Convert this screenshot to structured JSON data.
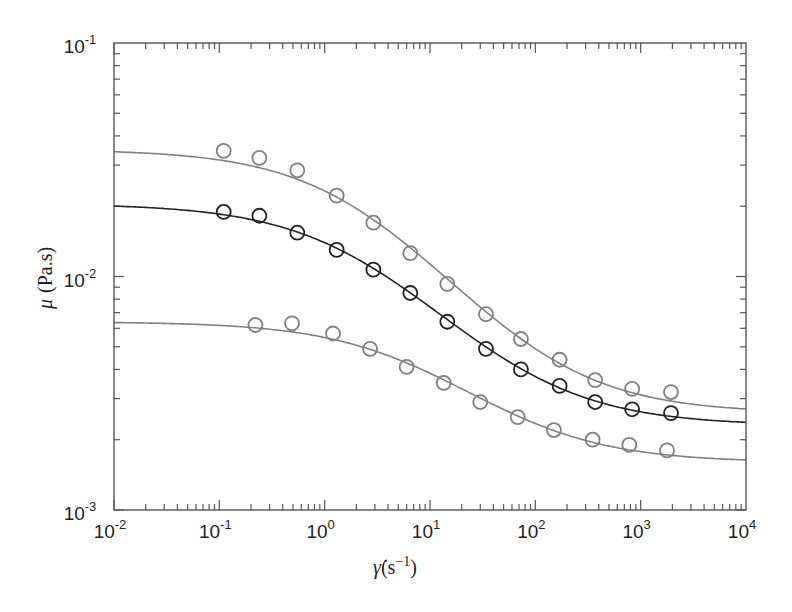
{
  "chart_data": {
    "type": "line",
    "title": "",
    "xlabel": "γ̇(s⁻¹)",
    "ylabel": "μ (Pa.s)",
    "xscale": "log",
    "yscale": "log",
    "xlim": [
      0.01,
      10000
    ],
    "ylim": [
      0.001,
      0.1
    ],
    "x_tick_labels": [
      "10^-2",
      "10^-1",
      "10^0",
      "10^1",
      "10^2",
      "10^3",
      "10^4"
    ],
    "y_tick_labels": [
      "10^-3",
      "10^-2",
      "10^-1"
    ],
    "grid": false,
    "legend": null,
    "series": [
      {
        "name": "upper",
        "color": "#808080",
        "marker": "open-circle",
        "fit_curve": {
          "mu0": 0.035,
          "mu_inf": 0.0026
        },
        "points": [
          {
            "x": 0.11,
            "y": 0.0345
          },
          {
            "x": 0.24,
            "y": 0.0322
          },
          {
            "x": 0.55,
            "y": 0.0285
          },
          {
            "x": 1.3,
            "y": 0.0222
          },
          {
            "x": 2.9,
            "y": 0.017
          },
          {
            "x": 6.5,
            "y": 0.0126
          },
          {
            "x": 14.6,
            "y": 0.0093
          },
          {
            "x": 34,
            "y": 0.0069
          },
          {
            "x": 73,
            "y": 0.0054
          },
          {
            "x": 170,
            "y": 0.0044
          },
          {
            "x": 370,
            "y": 0.0036
          },
          {
            "x": 830,
            "y": 0.0033
          },
          {
            "x": 1940,
            "y": 0.0032
          }
        ]
      },
      {
        "name": "middle",
        "color": "#222222",
        "marker": "open-circle",
        "fit_curve": {
          "mu0": 0.0205,
          "mu_inf": 0.0023
        },
        "points": [
          {
            "x": 0.11,
            "y": 0.0189
          },
          {
            "x": 0.24,
            "y": 0.0182
          },
          {
            "x": 0.55,
            "y": 0.0154
          },
          {
            "x": 1.3,
            "y": 0.013
          },
          {
            "x": 2.9,
            "y": 0.0107
          },
          {
            "x": 6.5,
            "y": 0.0085
          },
          {
            "x": 14.6,
            "y": 0.0064
          },
          {
            "x": 34,
            "y": 0.0049
          },
          {
            "x": 73,
            "y": 0.004
          },
          {
            "x": 170,
            "y": 0.0034
          },
          {
            "x": 370,
            "y": 0.0029
          },
          {
            "x": 830,
            "y": 0.0027
          },
          {
            "x": 1940,
            "y": 0.0026
          }
        ]
      },
      {
        "name": "lower",
        "color": "#808080",
        "marker": "open-circle",
        "fit_curve": {
          "mu0": 0.0064,
          "mu_inf": 0.0016
        },
        "points": [
          {
            "x": 0.22,
            "y": 0.0062
          },
          {
            "x": 0.49,
            "y": 0.0063
          },
          {
            "x": 1.2,
            "y": 0.0057
          },
          {
            "x": 2.7,
            "y": 0.0049
          },
          {
            "x": 6.0,
            "y": 0.0041
          },
          {
            "x": 13.5,
            "y": 0.0035
          },
          {
            "x": 30,
            "y": 0.0029
          },
          {
            "x": 68,
            "y": 0.0025
          },
          {
            "x": 150,
            "y": 0.0022
          },
          {
            "x": 350,
            "y": 0.002
          },
          {
            "x": 780,
            "y": 0.0019
          },
          {
            "x": 1780,
            "y": 0.0018
          }
        ]
      }
    ]
  },
  "labels": {
    "ylabel_mu": "μ",
    "ylabel_unit": "(Pa.s)",
    "xlabel_symbol": "γ̇",
    "xlabel_unit": "(s",
    "xlabel_exp": "−1",
    "xlabel_close": ")"
  }
}
